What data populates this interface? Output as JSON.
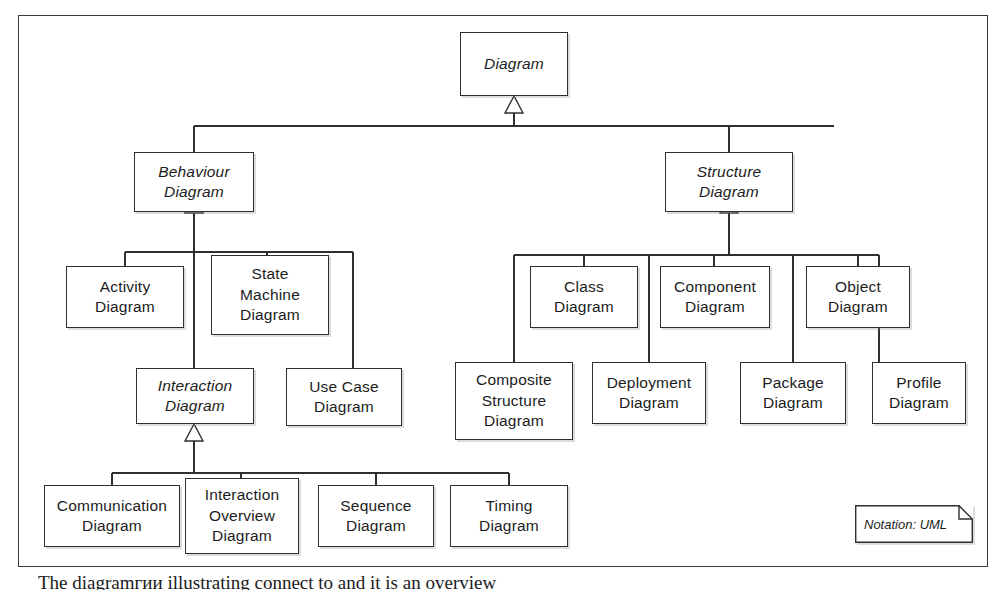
{
  "diagram": {
    "notation_note": "Notation: UML",
    "caption": "The diagramгии illustrating connect to and it is an overview",
    "colors": {
      "line": "#2f2f2f",
      "frame": "#3a3a3a",
      "text": "#1c1c1c",
      "background": "#ffffff"
    },
    "nodes": {
      "diagram": {
        "label": "Diagram",
        "abstract": true
      },
      "behaviour_diagram": {
        "label": "Behaviour\nDiagram",
        "abstract": true
      },
      "structure_diagram": {
        "label": "Structure\nDiagram",
        "abstract": true
      },
      "activity_diagram": {
        "label": "Activity\nDiagram",
        "abstract": false
      },
      "state_machine_diagram": {
        "label": "State\nMachine\nDiagram",
        "abstract": false
      },
      "interaction_diagram": {
        "label": "Interaction\nDiagram",
        "abstract": true
      },
      "use_case_diagram": {
        "label": "Use Case\nDiagram",
        "abstract": false
      },
      "class_diagram": {
        "label": "Class\nDiagram",
        "abstract": false
      },
      "component_diagram": {
        "label": "Component\nDiagram",
        "abstract": false
      },
      "object_diagram": {
        "label": "Object\nDiagram",
        "abstract": false
      },
      "composite_structure_diagram": {
        "label": "Composite\nStructure\nDiagram",
        "abstract": false
      },
      "deployment_diagram": {
        "label": "Deployment\nDiagram",
        "abstract": false
      },
      "package_diagram": {
        "label": "Package\nDiagram",
        "abstract": false
      },
      "profile_diagram": {
        "label": "Profile\nDiagram",
        "abstract": false
      },
      "communication_diagram": {
        "label": "Communication\nDiagram",
        "abstract": false
      },
      "interaction_overview_diagram": {
        "label": "Interaction\nOverview\nDiagram",
        "abstract": false
      },
      "sequence_diagram": {
        "label": "Sequence\nDiagram",
        "abstract": false
      },
      "timing_diagram": {
        "label": "Timing\nDiagram",
        "abstract": false
      }
    },
    "generalizations": [
      {
        "child": "behaviour_diagram",
        "parent": "diagram"
      },
      {
        "child": "structure_diagram",
        "parent": "diagram"
      },
      {
        "child": "activity_diagram",
        "parent": "behaviour_diagram"
      },
      {
        "child": "state_machine_diagram",
        "parent": "behaviour_diagram"
      },
      {
        "child": "interaction_diagram",
        "parent": "behaviour_diagram"
      },
      {
        "child": "use_case_diagram",
        "parent": "behaviour_diagram"
      },
      {
        "child": "class_diagram",
        "parent": "structure_diagram"
      },
      {
        "child": "component_diagram",
        "parent": "structure_diagram"
      },
      {
        "child": "object_diagram",
        "parent": "structure_diagram"
      },
      {
        "child": "composite_structure_diagram",
        "parent": "structure_diagram"
      },
      {
        "child": "deployment_diagram",
        "parent": "structure_diagram"
      },
      {
        "child": "package_diagram",
        "parent": "structure_diagram"
      },
      {
        "child": "profile_diagram",
        "parent": "structure_diagram"
      },
      {
        "child": "communication_diagram",
        "parent": "interaction_diagram"
      },
      {
        "child": "interaction_overview_diagram",
        "parent": "interaction_diagram"
      },
      {
        "child": "sequence_diagram",
        "parent": "interaction_diagram"
      },
      {
        "child": "timing_diagram",
        "parent": "interaction_diagram"
      }
    ]
  }
}
